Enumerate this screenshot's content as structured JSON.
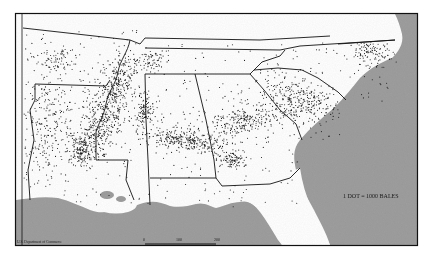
{
  "map": {
    "title": "",
    "legend": {
      "text": "1 DOT = 1000 BALES",
      "dot_value": 1000,
      "unit": "bales"
    },
    "scale_bar": {
      "ticks": [
        "0",
        "100",
        "200"
      ],
      "unit_label": "Miles"
    },
    "credit": "U.S. Department of Commerce",
    "colors": {
      "land": "#ffffff",
      "water": "#9e9e9e",
      "water_dark": "#8a8a8a",
      "border": "#111111",
      "dot": "#1a1a1a",
      "frame": "#111111"
    },
    "frame": {
      "x": 15,
      "y": 13,
      "width": 403,
      "height": 233
    },
    "states": [
      "Missouri",
      "Kentucky",
      "Virginia",
      "Tennessee",
      "North Carolina",
      "Arkansas",
      "Oklahoma",
      "Texas",
      "Louisiana",
      "Mississippi",
      "Alabama",
      "Georgia",
      "South Carolina",
      "Florida"
    ],
    "density_regions": [
      {
        "name": "mississippi-delta",
        "cx": 103,
        "cy": 118,
        "rx": 20,
        "ry": 40,
        "rot": 25,
        "count": 420
      },
      {
        "name": "delta-north",
        "cx": 120,
        "cy": 78,
        "rx": 14,
        "ry": 22,
        "rot": 20,
        "count": 180
      },
      {
        "name": "red-river-la",
        "cx": 82,
        "cy": 150,
        "rx": 14,
        "ry": 16,
        "rot": 0,
        "count": 160
      },
      {
        "name": "black-belt-al",
        "cx": 185,
        "cy": 140,
        "rx": 40,
        "ry": 9,
        "rot": 10,
        "count": 300
      },
      {
        "name": "mississippi-east",
        "cx": 145,
        "cy": 110,
        "rx": 8,
        "ry": 14,
        "rot": 0,
        "count": 110
      },
      {
        "name": "georgia-piedmont",
        "cx": 245,
        "cy": 120,
        "rx": 38,
        "ry": 14,
        "rot": -15,
        "count": 260
      },
      {
        "name": "sw-georgia",
        "cx": 232,
        "cy": 160,
        "rx": 12,
        "ry": 8,
        "rot": 0,
        "count": 90
      },
      {
        "name": "carolinas",
        "cx": 300,
        "cy": 100,
        "rx": 36,
        "ry": 22,
        "rot": 20,
        "count": 320
      },
      {
        "name": "nc-coastal-plain",
        "cx": 370,
        "cy": 52,
        "rx": 20,
        "ry": 18,
        "rot": 0,
        "count": 140
      },
      {
        "name": "texas-east",
        "cx": 45,
        "cy": 120,
        "rx": 22,
        "ry": 50,
        "rot": 0,
        "count": 230
      },
      {
        "name": "oklahoma",
        "cx": 55,
        "cy": 60,
        "rx": 22,
        "ry": 14,
        "rot": 0,
        "count": 80
      },
      {
        "name": "west-tennessee",
        "cx": 150,
        "cy": 60,
        "rx": 14,
        "ry": 10,
        "rot": 0,
        "count": 70
      },
      {
        "name": "scatter",
        "cx": 200,
        "cy": 120,
        "rx": 190,
        "ry": 90,
        "rot": 0,
        "count": 520
      }
    ]
  }
}
